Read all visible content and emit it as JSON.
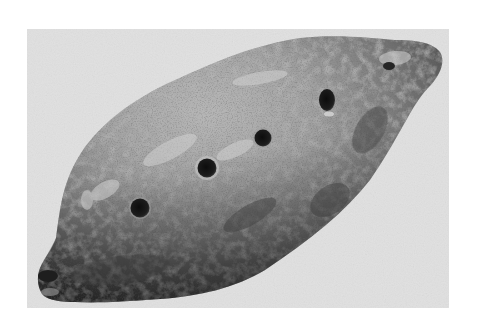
{
  "image": {
    "subject": "ancient clay ocarina",
    "description": "Grayscale photograph of an elongated clay vessel flute with four finger holes along its top, a small hole near the upper right tip, and a mouthpiece opening at the lower left end.",
    "style": "black-and-white photograph",
    "colors": {
      "page_background": "#ffffff",
      "photo_background": "#e0e0e0",
      "clay_light": "#b8b8b8",
      "clay_mid": "#8a8a8a",
      "clay_dark": "#4e4e4e",
      "hole": "#1a1a1a"
    },
    "finger_holes": [
      {
        "cx": 140,
        "cy": 208,
        "r": 10
      },
      {
        "cx": 207,
        "cy": 168,
        "r": 10
      },
      {
        "cx": 263,
        "cy": 138,
        "r": 9
      },
      {
        "cx": 327,
        "cy": 100,
        "r": 9
      }
    ],
    "thumb_hole": {
      "cx": 389,
      "cy": 66,
      "r": 5
    },
    "mouthpiece": {
      "cx": 47,
      "cy": 276
    }
  }
}
